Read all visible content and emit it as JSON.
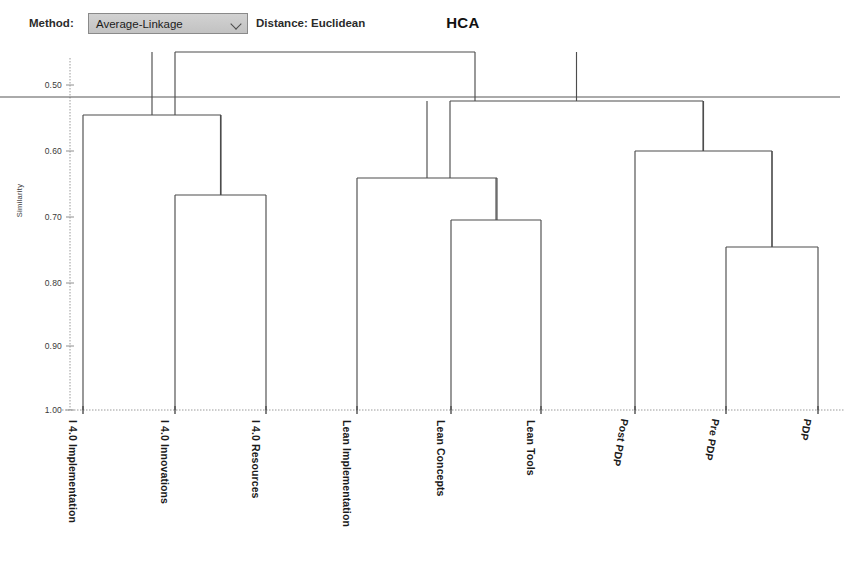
{
  "toolbar": {
    "method_label": "Method:",
    "method_value": "Average-Linkage",
    "distance_label": "Distance: Euclidean",
    "chevron_icon": "chevron-down-icon"
  },
  "chart_data": {
    "type": "dendrogram",
    "title": "HCA",
    "xlabel": "",
    "ylabel": "Similarity",
    "ylim": [
      0.45,
      1.0
    ],
    "y_inverted": true,
    "grid": false,
    "yticks": [
      {
        "value": 0.5,
        "label": "0.50",
        "py": 85
      },
      {
        "value": 0.6,
        "label": "0.60",
        "py": 151
      },
      {
        "value": 0.7,
        "label": "0.70",
        "py": 217
      },
      {
        "value": 0.8,
        "label": "0.80",
        "py": 283
      },
      {
        "value": 0.9,
        "label": "0.90",
        "py": 346
      },
      {
        "value": 1.0,
        "label": "1.00",
        "py": 410
      }
    ],
    "leaves": [
      {
        "name": "I 4.0 Implementation",
        "x": 83
      },
      {
        "name": "I 4.0 Innovations",
        "x": 175
      },
      {
        "name": "I 4.0 Resources",
        "x": 266
      },
      {
        "name": "Lean Implementation",
        "x": 357
      },
      {
        "name": "Lean Concepts",
        "x": 451
      },
      {
        "name": "Lean Tools",
        "x": 541
      },
      {
        "name": "Post PDP",
        "x": 635
      },
      {
        "name": "Pre PDP",
        "x": 726
      },
      {
        "name": "PDP",
        "x": 818
      }
    ],
    "merges": [
      {
        "id": "m1",
        "label": "I 4.0 Innovations + I 4.0 Resources",
        "similarity": 0.665,
        "left_x": 175,
        "right_x": 266,
        "py": 195
      },
      {
        "id": "m2",
        "label": "I 4.0 Implementation + m1",
        "similarity": 0.545,
        "left_x": 83,
        "right_x": 221,
        "py": 115
      },
      {
        "id": "m3",
        "label": "Lean Concepts + Lean Tools",
        "similarity": 0.705,
        "left_x": 451,
        "right_x": 541,
        "py": 220
      },
      {
        "id": "m4",
        "label": "Lean Implementation + m3",
        "similarity": 0.637,
        "left_x": 357,
        "right_x": 497,
        "py": 178
      },
      {
        "id": "m5",
        "label": "Pre PDP + PDP",
        "similarity": 0.747,
        "left_x": 726,
        "right_x": 818,
        "py": 247
      },
      {
        "id": "m6",
        "label": "Post PDP + m5",
        "similarity": 0.592,
        "left_x": 635,
        "right_x": 772,
        "py": 151
      },
      {
        "id": "m7",
        "label": "m4 + m6",
        "similarity": 0.516,
        "left_x": 450,
        "right_x": 703,
        "py": 101
      },
      {
        "id": "m8",
        "label": "m2 + m7",
        "similarity": 0.441,
        "left_x": 175,
        "right_x": 475,
        "py": 52
      }
    ],
    "cut_line": {
      "label": "similarity cut",
      "similarity": 0.507,
      "py": 97,
      "x_start": 0,
      "x_end": 840
    }
  },
  "colors": {
    "link": "#4d4d4d",
    "axis": "#8f8f8f",
    "text": "#1a1a1a",
    "control_bg": "#c8c8c8"
  }
}
